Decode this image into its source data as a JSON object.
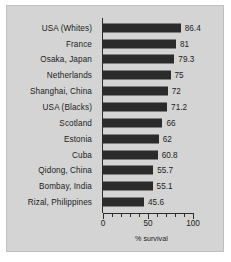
{
  "chart_data": {
    "type": "bar",
    "orientation": "horizontal",
    "title": "",
    "subtitle": "",
    "xlabel": "% survival",
    "ylabel": "",
    "xlim": [
      0,
      100
    ],
    "xticks": [
      0,
      10,
      20,
      30,
      40,
      50,
      60,
      70,
      80,
      90,
      100
    ],
    "xtick_labels": [
      "0",
      "",
      "",
      "",
      "",
      "50",
      "",
      "",
      "",
      "",
      "100"
    ],
    "major_tick_labels": [
      "0",
      "50",
      "100"
    ],
    "grid": false,
    "legend": null,
    "bar_color": "#2b2b2b",
    "panel_color": "#d4d4d4",
    "categories": [
      "USA (Whites)",
      "France",
      "Osaka, Japan",
      "Netherlands",
      "Shanghai, China",
      "USA (Blacks)",
      "Scotland",
      "Estonia",
      "Cuba",
      "Qidong, China",
      "Bombay, India",
      "Rizal, Philippines"
    ],
    "values": [
      86.4,
      81,
      79.3,
      75,
      72,
      71.2,
      66,
      62,
      60.8,
      55.7,
      55.1,
      45.6
    ],
    "value_labels": [
      "86.4",
      "81",
      "79.3",
      "75",
      "72",
      "71.2",
      "66",
      "62",
      "60.8",
      "55.7",
      "55.1",
      "45.6"
    ]
  }
}
